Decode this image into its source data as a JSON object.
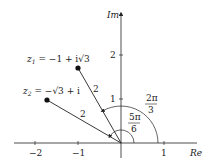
{
  "axes": {
    "x_label": "Re",
    "y_label": "Im",
    "x_ticks": [
      "−2",
      "−1",
      "1"
    ],
    "y_ticks": [
      "1",
      "2"
    ]
  },
  "points": {
    "z1": {
      "label_name": "z",
      "label_sub": "1",
      "label_expr": " = −1 + i√3",
      "segment_length": "2"
    },
    "z2": {
      "label_name": "z",
      "label_sub": "2",
      "label_expr": " = −√3 + i",
      "segment_length": "2"
    }
  },
  "angles": {
    "large": {
      "num": "2π",
      "den": "3"
    },
    "small": {
      "num": "5π",
      "den": "6"
    }
  },
  "colors": {
    "ink": "#222222"
  }
}
